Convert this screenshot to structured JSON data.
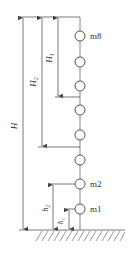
{
  "diagram": {
    "type": "multi-mass vertical column with height dimensions",
    "colors": {
      "line": "#555555",
      "text": "#333333",
      "background": "#ffffff"
    },
    "masses": [
      {
        "label": "m8",
        "y": 36
      },
      {
        "label": "",
        "y": 62
      },
      {
        "label": "",
        "y": 86
      },
      {
        "label": "",
        "y": 110
      },
      {
        "label": "",
        "y": 135
      },
      {
        "label": "",
        "y": 160
      },
      {
        "label": "m2",
        "y": 184
      },
      {
        "label": "m1",
        "y": 209
      }
    ],
    "dimensions": {
      "H": {
        "label": "H"
      },
      "H1": {
        "label": "H",
        "sub": "1"
      },
      "H2": {
        "label": "H",
        "sub": "2"
      },
      "h1": {
        "label": "h",
        "sub": "1"
      },
      "h2": {
        "label": "h",
        "sub": "2"
      }
    },
    "ground": {
      "label": "ground"
    }
  }
}
